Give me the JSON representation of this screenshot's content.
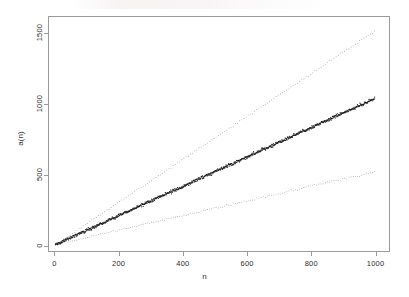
{
  "chart_data": {
    "type": "scatter",
    "title": "",
    "xlabel": "n",
    "ylabel": "a(n)",
    "xlim": [
      -20,
      1045
    ],
    "ylim": [
      -45,
      1620
    ],
    "grid": false,
    "legend": null,
    "x_ticks": [
      0,
      200,
      400,
      600,
      800,
      1000
    ],
    "x_tick_labels": [
      "0",
      "200",
      "400",
      "600",
      "800",
      "1000"
    ],
    "y_ticks": [
      0,
      500,
      1000,
      1500
    ],
    "y_tick_labels": [
      "0",
      "500",
      "1000",
      "1500"
    ],
    "point_color": "#1a1a1a",
    "axis_color": "#9a9a9a",
    "series": [
      {
        "name": "upper-envelope",
        "style": "sparse-dots",
        "slope": 1.52,
        "intercept": 0,
        "n_points": 150,
        "jitter": 6,
        "x_start": 0,
        "x_end": 1000,
        "y_start": 0,
        "y_end": 1520,
        "opacity": 0.62,
        "dot_size": 0.85
      },
      {
        "name": "main-band",
        "style": "dense-scatter",
        "slope": 1.04,
        "intercept": 0,
        "n_points": 1000,
        "jitter": 11,
        "x_start": 0,
        "x_end": 1000,
        "y_start": 0,
        "y_end": 1040,
        "opacity": 0.95,
        "dot_size": 1.0
      },
      {
        "name": "lower-envelope",
        "style": "sparse-dots",
        "slope": 0.52,
        "intercept": 0,
        "n_points": 150,
        "jitter": 6,
        "x_start": 0,
        "x_end": 1000,
        "y_start": 0,
        "y_end": 520,
        "opacity": 0.62,
        "dot_size": 0.85
      }
    ]
  }
}
